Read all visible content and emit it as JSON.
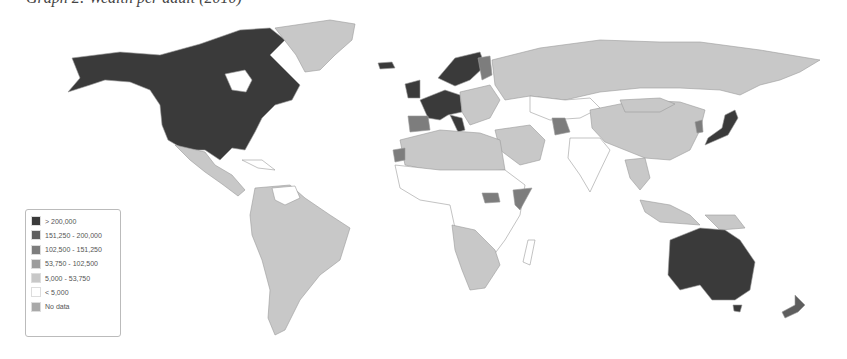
{
  "figure": {
    "title": "Graph 2: Wealth per adult (2010)"
  },
  "colors": {
    "gt_200000": "#3a3a3a",
    "151250_200000": "#5e5e5e",
    "102500_151250": "#7d7d7d",
    "53750_102500": "#9c9c9c",
    "5000_53750": "#c8c8c8",
    "lt_5000": "#ffffff",
    "no_data": "#a9a9a9",
    "border": "#9a9a9a"
  },
  "legend": {
    "items": [
      {
        "label": "> 200,000",
        "color": "#3a3a3a"
      },
      {
        "label": "151,250 - 200,000",
        "color": "#5e5e5e"
      },
      {
        "label": "102,500 - 151,250",
        "color": "#7d7d7d"
      },
      {
        "label": "53,750 - 102,500",
        "color": "#9c9c9c"
      },
      {
        "label": "5,000 - 53,750",
        "color": "#c8c8c8"
      },
      {
        "label": "< 5,000",
        "color": "#ffffff"
      },
      {
        "label": "No data",
        "color": "#a9a9a9"
      }
    ]
  },
  "map": {
    "type": "choropleth-world",
    "regions": [
      {
        "name": "North America (USA, Canada)",
        "class": "> 200,000"
      },
      {
        "name": "Greenland",
        "class": "5,000 - 53,750"
      },
      {
        "name": "Mexico & Central America",
        "class": "5,000 - 53,750"
      },
      {
        "name": "South America",
        "class": "5,000 - 53,750"
      },
      {
        "name": "Western Europe & Scandinavia",
        "class": "> 200,000"
      },
      {
        "name": "Spain/Portugal",
        "class": "102,500 - 151,250"
      },
      {
        "name": "Russia",
        "class": "5,000 - 53,750"
      },
      {
        "name": "China",
        "class": "5,000 - 53,750"
      },
      {
        "name": "Japan",
        "class": "> 200,000"
      },
      {
        "name": "Australia",
        "class": "> 200,000"
      },
      {
        "name": "New Zealand",
        "class": "151,250 - 200,000"
      },
      {
        "name": "Sub-Saharan Africa (most)",
        "class": "< 5,000"
      },
      {
        "name": "Southern Africa",
        "class": "5,000 - 53,750"
      },
      {
        "name": "India",
        "class": "< 5,000"
      },
      {
        "name": "Southeast Asia",
        "class": "5,000 - 53,750"
      }
    ]
  }
}
